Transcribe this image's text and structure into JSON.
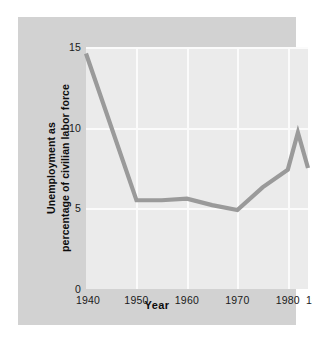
{
  "figure": {
    "background_color": "#ffffff",
    "panel_color": "#d2d2d2",
    "plot_color": "#ebebeb",
    "grid_color": "#fbfbfb",
    "line_color": "#9a9a9a"
  },
  "chart_data": {
    "type": "line",
    "title": "",
    "subtitle": "",
    "xlabel": "Year",
    "ylabel": "Unemployment as percentage of civilian labor force",
    "ylabel_line1": "Unemployment as",
    "ylabel_line2": "percentage of civilian labor force",
    "xlim": [
      1940,
      1984
    ],
    "ylim": [
      0,
      15
    ],
    "yticks": [
      0,
      5,
      10,
      15
    ],
    "ytick_labels": [
      "0",
      "5",
      "10",
      "15"
    ],
    "xticks": [
      1940,
      1950,
      1960,
      1970,
      1980,
      1984
    ],
    "xtick_labels": [
      "1940",
      "1950",
      "1960",
      "1970",
      "1980",
      "1984"
    ],
    "grid": true,
    "grid_axis": "both",
    "legend": false,
    "legend_position": "none",
    "series": [
      {
        "name": "Unemployment rate",
        "color": "#9a9a9a",
        "x": [
          1940,
          1950,
          1955,
          1960,
          1965,
          1970,
          1975,
          1980,
          1982,
          1984
        ],
        "values": [
          14.6,
          5.5,
          5.5,
          5.6,
          5.2,
          4.9,
          6.3,
          7.4,
          9.7,
          7.5
        ]
      }
    ]
  }
}
